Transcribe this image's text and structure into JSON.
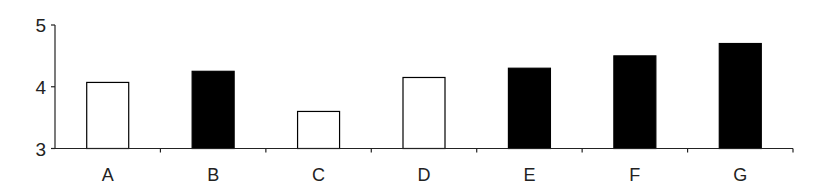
{
  "chart_data": {
    "type": "bar",
    "title": "",
    "xlabel": "",
    "ylabel": "",
    "categories": [
      "A",
      "B",
      "C",
      "D",
      "E",
      "F",
      "G"
    ],
    "values": [
      4.07,
      4.25,
      3.6,
      4.15,
      4.3,
      4.5,
      4.7
    ],
    "bar_fill": [
      "white",
      "black",
      "white",
      "white",
      "black",
      "black",
      "black"
    ],
    "ylim": [
      3,
      5
    ],
    "yticks": [
      3,
      4,
      5
    ],
    "grid": false,
    "legend": null
  },
  "colors": {
    "filled": "#000000",
    "hollow": "#ffffff",
    "axis": "#222222"
  }
}
